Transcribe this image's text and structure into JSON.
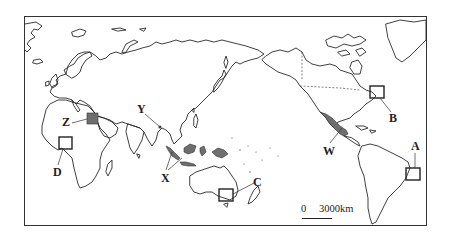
{
  "map": {
    "title": "",
    "labels": {
      "A": "A",
      "B": "B",
      "C": "C",
      "D": "D",
      "W": "W",
      "X": "X",
      "Y": "Y",
      "Z": "Z"
    },
    "scale": {
      "zero": "0",
      "distance": "3000km"
    },
    "regions": [
      {
        "id": "A",
        "type": "box",
        "location": "eastern Brazil coast"
      },
      {
        "id": "B",
        "type": "box",
        "location": "Great Lakes / northeastern USA"
      },
      {
        "id": "C",
        "type": "box",
        "location": "southeastern Australia"
      },
      {
        "id": "D",
        "type": "box",
        "location": "West Africa (Gulf of Guinea)"
      },
      {
        "id": "W",
        "type": "shaded",
        "location": "Mexico"
      },
      {
        "id": "X",
        "type": "shaded",
        "location": "Indonesia / Maritime Southeast Asia"
      },
      {
        "id": "Y",
        "type": "point",
        "location": "Bangladesh / Ganges delta"
      },
      {
        "id": "Z",
        "type": "shaded",
        "location": "Egypt"
      }
    ],
    "colors": {
      "outline": "#2a2a2a",
      "shade": "#6e6e6e",
      "frame": "#333333",
      "background": "#ffffff"
    }
  }
}
